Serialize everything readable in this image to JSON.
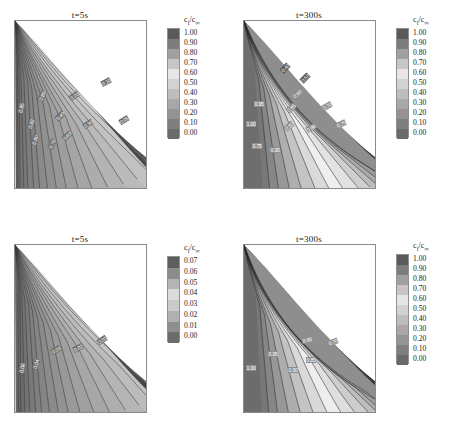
{
  "figure": {
    "background": "#ffffff",
    "panel_count": 4
  },
  "colorbar_title": {
    "main": "c",
    "sub": "f",
    "slash": "/",
    "main2": "c",
    "sub2": "∞"
  },
  "panels": [
    {
      "id": "top-left",
      "title": "t=5s",
      "colorbar": {
        "ticks": [
          "1.00",
          "0.90",
          "0.80",
          "0.70",
          "0.60",
          "0.50",
          "0.40",
          "0.30",
          "0.20",
          "0.10",
          "0.00"
        ],
        "colors": [
          "#5a5a5a",
          "#7d7d7d",
          "#a0a0a0",
          "#c6c6c6",
          "#e6e6e6",
          "#d2d2d2",
          "#bdbdbd",
          "#a8a8a8",
          "#949494",
          "#7f7f7f",
          "#6a6a6a"
        ],
        "max": 1.0,
        "min": 0.0,
        "step": 0.1
      },
      "contour_labels": [
        "0.95",
        "0.90",
        "0.85",
        "0.80",
        "0.70",
        "0.60",
        "0.40",
        "0.30",
        "0.20",
        "0.10",
        "0.05"
      ]
    },
    {
      "id": "top-right",
      "title": "t=300s",
      "colorbar": {
        "ticks": [
          "1.00",
          "0.90",
          "0.80",
          "0.70",
          "0.60",
          "0.50",
          "0.40",
          "0.30",
          "0.20",
          "0.10",
          "0.00"
        ],
        "colors": [
          "#5a5a5a",
          "#7d7d7d",
          "#a0a0a0",
          "#c6c6c6",
          "#e6e6e6",
          "#d2d2d2",
          "#bdbdbd",
          "#a8a8a8",
          "#949494",
          "#7f7f7f",
          "#6a6a6a"
        ],
        "max": 1.0,
        "min": 0.0,
        "step": 0.1
      },
      "contour_labels": [
        "1.00",
        "0.95",
        "0.90",
        "0.85",
        "0.80",
        "0.75",
        "0.70",
        "0.60",
        "0.50",
        "0.40"
      ]
    },
    {
      "id": "bottom-left",
      "title": "t=5s",
      "colorbar": {
        "ticks": [
          "0.07",
          "0.06",
          "0.05",
          "0.04",
          "0.03",
          "0.02",
          "0.01",
          "0.00"
        ],
        "colors": [
          "#5e5e5e",
          "#8c8c8c",
          "#b4b4b4",
          "#dcdcdc",
          "#cacaca",
          "#b0b0b0",
          "#8f8f8f",
          "#6c6c6c"
        ],
        "max": 0.07,
        "min": 0.0,
        "step": 0.01
      },
      "contour_labels": [
        "0.06",
        "0.04",
        "0.03",
        "0.02",
        "0.01"
      ]
    },
    {
      "id": "bottom-right",
      "title": "t=300s",
      "colorbar": {
        "ticks": [
          "1.00",
          "0.90",
          "0.80",
          "0.70",
          "0.60",
          "0.50",
          "0.40",
          "0.30",
          "0.20",
          "0.10",
          "0.00"
        ],
        "colors": [
          "#5a5a5a",
          "#7d7d7d",
          "#a0a0a0",
          "#c6c6c6",
          "#e6e6e6",
          "#d2d2d2",
          "#bdbdbd",
          "#a8a8a8",
          "#949494",
          "#7f7f7f",
          "#6a6a6a"
        ],
        "max": 1.0,
        "min": 0.0,
        "step": 0.1
      },
      "contour_labels": [
        "1.00",
        "0.95",
        "0.90",
        "0.85",
        "0.80",
        "0.70"
      ]
    }
  ],
  "chart_data": {
    "type": "contour",
    "title": "",
    "xlabel": "",
    "ylabel": "",
    "subplots": [
      {
        "name": "top-left",
        "title": "t=5s",
        "variable": "c_f/c_inf",
        "colorbar_range": [
          0.0,
          1.0
        ],
        "colorbar_step": 0.1,
        "colorbar_ticks": [
          1.0,
          0.9,
          0.8,
          0.7,
          0.6,
          0.5,
          0.4,
          0.3,
          0.2,
          0.1,
          0.0
        ],
        "labeled_contours": [
          0.95,
          0.9,
          0.85,
          0.8,
          0.7,
          0.6,
          0.4,
          0.3,
          0.2,
          0.1,
          0.05
        ],
        "domain_shape": "right-triangle-wedge",
        "description": "Closely spaced near-vertical contours fanning from upper-left corner down to the lower boundary; contour density highest near left edge."
      },
      {
        "name": "top-right",
        "title": "t=300s",
        "variable": "c_f/c_inf",
        "colorbar_range": [
          0.0,
          1.0
        ],
        "colorbar_step": 0.1,
        "colorbar_ticks": [
          1.0,
          0.9,
          0.8,
          0.7,
          0.6,
          0.5,
          0.4,
          0.3,
          0.2,
          0.1,
          0.0
        ],
        "labeled_contours": [
          1.0,
          0.95,
          0.9,
          0.85,
          0.8,
          0.75,
          0.7,
          0.6,
          0.5,
          0.4
        ],
        "domain_shape": "right-triangle-wedge",
        "description": "Broad uniform high-value region on the left; steep gradient band compressed along the hypotenuse (upper-right diagonal)."
      },
      {
        "name": "bottom-left",
        "title": "t=5s",
        "variable": "c_f/c_inf",
        "colorbar_range": [
          0.0,
          0.07
        ],
        "colorbar_step": 0.01,
        "colorbar_ticks": [
          0.07,
          0.06,
          0.05,
          0.04,
          0.03,
          0.02,
          0.01,
          0.0
        ],
        "labeled_contours": [
          0.06,
          0.04,
          0.03,
          0.02,
          0.01
        ],
        "domain_shape": "right-triangle-wedge",
        "description": "Fanned near-vertical contours from upper-left corner; dark band along the hypotenuse indicating highest values."
      },
      {
        "name": "bottom-right",
        "title": "t=300s",
        "variable": "c_f/c_inf",
        "colorbar_range": [
          0.0,
          1.0
        ],
        "colorbar_step": 0.1,
        "colorbar_ticks": [
          1.0,
          0.9,
          0.8,
          0.7,
          0.6,
          0.5,
          0.4,
          0.3,
          0.2,
          0.1,
          0.0
        ],
        "labeled_contours": [
          1.0,
          0.95,
          0.9,
          0.85,
          0.8,
          0.7
        ],
        "domain_shape": "right-triangle-wedge",
        "description": "Large uniform plateau at left; tightly packed contour bands hugging the diagonal hypotenuse."
      }
    ]
  }
}
